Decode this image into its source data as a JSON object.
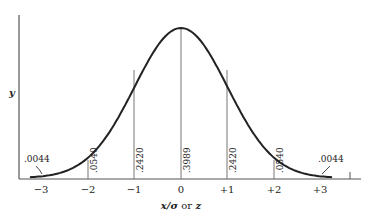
{
  "chart_data": {
    "type": "line",
    "title": "",
    "xlabel": "x/σ or z",
    "ylabel": "y",
    "x_ticks": [
      "−3",
      "−2",
      "−1",
      "0",
      "+1",
      "+2",
      "+3"
    ],
    "x_values": [
      -3,
      -2,
      -1,
      0,
      1,
      2,
      3
    ],
    "ordinates": [
      {
        "x": -3,
        "label": ".0044"
      },
      {
        "x": -2,
        "label": ".0540"
      },
      {
        "x": -1,
        "label": ".2420"
      },
      {
        "x": 0,
        "label": ".3989"
      },
      {
        "x": 1,
        "label": ".2420"
      },
      {
        "x": 2,
        "label": ".0540"
      },
      {
        "x": 3,
        "label": ".0044"
      }
    ],
    "series": [
      {
        "name": "standard normal density",
        "function": "y = (1/√(2π)) e^(−z²/2)"
      }
    ],
    "xlim": [
      -3.4,
      3.4
    ],
    "ylim": [
      0,
      0.4
    ],
    "grid": false,
    "legend": null
  },
  "labels": {
    "y_axis": "y",
    "x_axis_x": "x/σ",
    "x_axis_or": "or",
    "x_axis_z": "z",
    "tail_left": ".0044",
    "tail_right": ".0044",
    "ord_m2": ".0540",
    "ord_m1": ".2420",
    "ord_0": ".3989",
    "ord_p1": ".2420",
    "ord_p2": ".0540",
    "tick_m3": "−3",
    "tick_m2": "−2",
    "tick_m1": "−1",
    "tick_0": "0",
    "tick_p1": "+1",
    "tick_p2": "+2",
    "tick_p3": "+3"
  }
}
